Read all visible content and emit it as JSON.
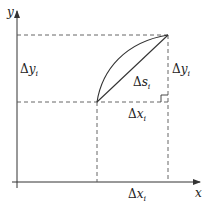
{
  "diagram": {
    "axes": {
      "x_label": "x",
      "y_label": "y"
    },
    "labels": {
      "delta_y_left": {
        "sym": "Δ",
        "var": "y",
        "sub": "i"
      },
      "delta_y_right": {
        "sym": "Δ",
        "var": "y",
        "sub": "i"
      },
      "delta_s": {
        "sym": "Δ",
        "var": "s",
        "sub": "i"
      },
      "delta_x_middle": {
        "sym": "Δ",
        "var": "x",
        "sub": "i"
      },
      "delta_x_bottom": {
        "sym": "Δ",
        "var": "x",
        "sub": "i"
      }
    },
    "points": {
      "start": [
        97,
        102
      ],
      "end": [
        168,
        35
      ]
    },
    "colors": {
      "line": "#333333",
      "dash": "#555555"
    }
  }
}
